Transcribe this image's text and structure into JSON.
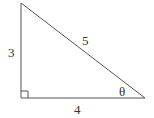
{
  "diagram": {
    "type": "right-triangle",
    "labels": {
      "vertical_side": "3",
      "horizontal_side": "4",
      "hypotenuse": "5",
      "angle": "θ"
    },
    "right_angle_marker": true,
    "stroke_color": "#555555",
    "text_color": "#333333"
  }
}
